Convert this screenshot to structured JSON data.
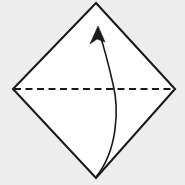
{
  "figure": {
    "kind": "origami-fold-diagram",
    "canvas": {
      "width": 185,
      "height": 185
    },
    "background_color": "#ededed",
    "paper_fill": "#ffffff",
    "stroke_color": "#1a1a1a"
  },
  "paper": {
    "name": "square-rotated-45",
    "points": "96,3 175,89 96,178 13,89",
    "edge_width": 2.1,
    "vertices": {
      "top": {
        "x": 96,
        "y": 3
      },
      "right": {
        "x": 175,
        "y": 89
      },
      "bottom": {
        "x": 96,
        "y": 178
      },
      "left": {
        "x": 13,
        "y": 89
      }
    }
  },
  "fold_line": {
    "name": "valley-fold-crease",
    "style": "dashed",
    "x1": 14,
    "y1": 89,
    "x2": 174,
    "y2": 89,
    "dash_length": 7,
    "dash_gap": 4.5,
    "width": 2
  },
  "fold_arrow": {
    "name": "fold-direction-arrow",
    "description": "curved arrow from bottom vertex up to top vertex",
    "path": "M 96,177 C 118,150 119,108 113,84 C 108,62 103,44 99,32",
    "width": 1.6,
    "head": {
      "points": "98,26 105,42 97,39 90,44",
      "tip": {
        "x": 98,
        "y": 26
      }
    }
  },
  "chart_data": {
    "type": "diagram",
    "elements": [
      {
        "label": "square paper (diamond orientation)",
        "shape": "polygon",
        "points": [
          [
            96,
            3
          ],
          [
            175,
            89
          ],
          [
            96,
            178
          ],
          [
            13,
            89
          ]
        ]
      },
      {
        "label": "horizontal crease line",
        "shape": "dashed-line",
        "from": [
          14,
          89
        ],
        "to": [
          174,
          89
        ]
      },
      {
        "label": "fold motion arrow",
        "shape": "curved-arrow",
        "from": [
          96,
          177
        ],
        "to": [
          98,
          26
        ],
        "bulge": "right"
      }
    ]
  }
}
